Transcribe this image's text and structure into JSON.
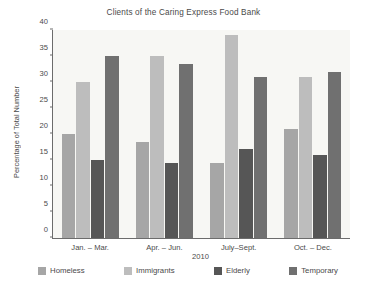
{
  "chart_data": {
    "type": "bar",
    "title": "Clients of the Caring Express Food Bank",
    "xlabel": "2010",
    "ylabel": "Percentage of Total Number",
    "categories": [
      "Jan. – Mar.",
      "Apr. – Jun.",
      "July–Sept.",
      "Oct. – Dec."
    ],
    "series": [
      {
        "name": "Homeless",
        "color": "#a6a6a6",
        "values": [
          20,
          18.5,
          14.5,
          21
        ]
      },
      {
        "name": "Immigrants",
        "color": "#bdbdbd",
        "values": [
          30,
          35,
          39,
          31
        ]
      },
      {
        "name": "Elderly",
        "color": "#565656",
        "values": [
          15,
          14.5,
          17.2,
          16
        ]
      },
      {
        "name": "Temporary",
        "color": "#707070",
        "values": [
          35,
          33.5,
          31,
          32
        ]
      }
    ],
    "ylim": [
      0,
      40
    ],
    "yticks": [
      0,
      5,
      10,
      15,
      20,
      25,
      30,
      35,
      40
    ],
    "ytick_labels": [
      "0",
      "5",
      "10",
      "15",
      "20",
      "25",
      "30",
      "35",
      "40"
    ],
    "grid": false,
    "legend_position": "bottom",
    "plot_background": "#f7f7f4",
    "axis_color": "#6c6c6c"
  }
}
